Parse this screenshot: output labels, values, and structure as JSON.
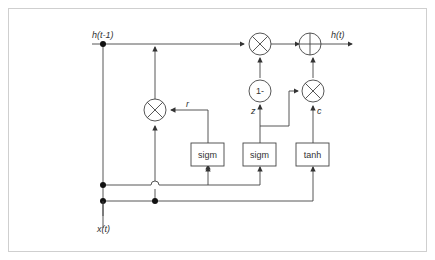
{
  "diagram": {
    "type": "GRU cell",
    "inputs": {
      "h_prev": "h(t-1)",
      "x": "x(t)"
    },
    "output": "h(t)",
    "gate_labels": {
      "reset": "r",
      "update": "z",
      "candidate": "c"
    },
    "blocks": [
      {
        "id": "sigm_r",
        "label": "sigm"
      },
      {
        "id": "sigm_z",
        "label": "sigm"
      },
      {
        "id": "tanh_c",
        "label": "tanh"
      }
    ],
    "one_minus": "1-",
    "colors": {
      "stroke": "#333333",
      "frame": "#cfcfcf",
      "background": "#ffffff"
    }
  }
}
